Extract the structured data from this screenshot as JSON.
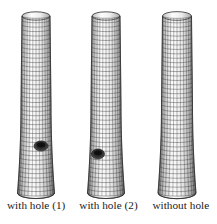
{
  "figure": {
    "title": "",
    "background_color": "#ffffff",
    "mesh_color": "#2b2b2b",
    "shading_color": "#9a9a9a",
    "hole_color": "#1a1a1a",
    "specimens": [
      {
        "id": "cylinder-1",
        "label": "with hole (1)",
        "has_hole": true,
        "center_x": 36,
        "top_y": 16,
        "bottom_y": 193,
        "top_half_width": 14,
        "mid_half_width": 15,
        "bottom_half_width": 18.5,
        "hole": {
          "cx": 41,
          "cy": 146,
          "rx": 7,
          "ry": 5
        }
      },
      {
        "id": "cylinder-2",
        "label": "with hole (2)",
        "has_hole": true,
        "center_x": 106,
        "top_y": 16,
        "bottom_y": 193,
        "top_half_width": 14,
        "mid_half_width": 15,
        "bottom_half_width": 18.5,
        "hole": {
          "cx": 98,
          "cy": 154,
          "rx": 6.5,
          "ry": 5
        }
      },
      {
        "id": "cylinder-3",
        "label": "without hole",
        "has_hole": false,
        "center_x": 177,
        "top_y": 16,
        "bottom_y": 193,
        "top_half_width": 14.5,
        "mid_half_width": 15.5,
        "bottom_half_width": 19,
        "hole": null
      }
    ],
    "mesh": {
      "circumferential_divisions": 14,
      "axial_divisions": 40
    }
  },
  "captions": [
    {
      "text": "with hole (1)"
    },
    {
      "text": "with hole (2)"
    },
    {
      "text": "without hole"
    }
  ]
}
